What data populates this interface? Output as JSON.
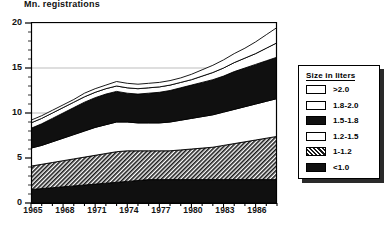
{
  "chart_data": {
    "type": "area",
    "title": "Mn. registrations",
    "ylabel": "Mn. registrations",
    "xlabel": "",
    "stacked": true,
    "grid": true,
    "legend_position": "right-outside",
    "xlim": [
      1965,
      1988
    ],
    "ylim": [
      0,
      20
    ],
    "yticks": [
      0,
      5,
      10,
      15,
      20
    ],
    "xticks": [
      1965,
      1968,
      1971,
      1974,
      1977,
      1980,
      1983,
      1986
    ],
    "x": [
      1965,
      1966,
      1967,
      1968,
      1969,
      1970,
      1971,
      1972,
      1973,
      1974,
      1975,
      1976,
      1977,
      1978,
      1979,
      1980,
      1981,
      1982,
      1983,
      1984,
      1985,
      1986,
      1987,
      1988
    ],
    "series": [
      {
        "name": "<1.0",
        "pattern": "solid-black",
        "values": [
          1.5,
          1.6,
          1.7,
          1.8,
          1.9,
          2.0,
          2.1,
          2.2,
          2.3,
          2.4,
          2.5,
          2.6,
          2.6,
          2.6,
          2.6,
          2.6,
          2.6,
          2.6,
          2.6,
          2.6,
          2.6,
          2.6,
          2.6,
          2.6
        ]
      },
      {
        "name": "1-1.2",
        "pattern": "dense-hatch-gray",
        "values": [
          2.6,
          2.7,
          2.8,
          2.9,
          3.0,
          3.1,
          3.2,
          3.3,
          3.4,
          3.4,
          3.3,
          3.2,
          3.2,
          3.2,
          3.3,
          3.4,
          3.5,
          3.6,
          3.8,
          4.0,
          4.2,
          4.4,
          4.6,
          4.8
        ]
      },
      {
        "name": "1.2-1.5",
        "pattern": "white",
        "values": [
          2.0,
          2.1,
          2.3,
          2.5,
          2.7,
          2.9,
          3.1,
          3.2,
          3.3,
          3.2,
          3.1,
          3.1,
          3.1,
          3.2,
          3.3,
          3.4,
          3.5,
          3.6,
          3.7,
          3.8,
          3.9,
          4.0,
          4.1,
          4.2
        ]
      },
      {
        "name": "1.5-1.8",
        "pattern": "solid-black",
        "values": [
          2.2,
          2.4,
          2.6,
          2.8,
          3.0,
          3.2,
          3.3,
          3.4,
          3.4,
          3.2,
          3.2,
          3.3,
          3.4,
          3.5,
          3.6,
          3.7,
          3.8,
          3.9,
          4.0,
          4.2,
          4.3,
          4.4,
          4.5,
          4.6
        ]
      },
      {
        "name": "1.8-2.0",
        "pattern": "white",
        "values": [
          0.6,
          0.6,
          0.6,
          0.6,
          0.6,
          0.6,
          0.6,
          0.6,
          0.6,
          0.6,
          0.6,
          0.6,
          0.6,
          0.6,
          0.6,
          0.6,
          0.7,
          0.8,
          0.9,
          1.0,
          1.1,
          1.2,
          1.4,
          1.6
        ]
      },
      {
        "name": ">2.0",
        "pattern": "white",
        "values": [
          0.3,
          0.3,
          0.3,
          0.3,
          0.3,
          0.4,
          0.4,
          0.4,
          0.5,
          0.5,
          0.5,
          0.5,
          0.5,
          0.5,
          0.5,
          0.6,
          0.7,
          0.8,
          0.9,
          1.0,
          1.1,
          1.3,
          1.5,
          1.7
        ]
      }
    ],
    "totals_approx": [
      9.2,
      9.7,
      10.3,
      10.9,
      11.5,
      12.2,
      12.7,
      13.1,
      13.5,
      13.3,
      13.2,
      13.3,
      13.4,
      13.6,
      13.9,
      14.3,
      14.8,
      15.3,
      15.9,
      16.6,
      17.2,
      17.9,
      18.7,
      19.5
    ]
  },
  "axis": {
    "ytitle": "Mn. registrations",
    "yticks": [
      "20",
      "15",
      "10",
      "5",
      "0"
    ],
    "xticks": [
      "1965",
      "1968",
      "1971",
      "1974",
      "1977",
      "1980",
      "1983",
      "1986"
    ]
  },
  "legend": {
    "title": "Size in liters",
    "items": [
      {
        "label": ">2.0",
        "swatch": "white"
      },
      {
        "label": "1.8-2.0",
        "swatch": "white"
      },
      {
        "label": "1.5-1.8",
        "swatch": "black"
      },
      {
        "label": "1.2-1.5",
        "swatch": "white"
      },
      {
        "label": "1-1.2",
        "swatch": "hatch"
      },
      {
        "label": "<1.0",
        "swatch": "black"
      }
    ]
  },
  "colors": {
    "ink": "#000000",
    "fill_black": "#101010",
    "fill_white": "#ffffff",
    "fill_hatch": "#6a6a6a",
    "grid": "#b9b9b9"
  }
}
